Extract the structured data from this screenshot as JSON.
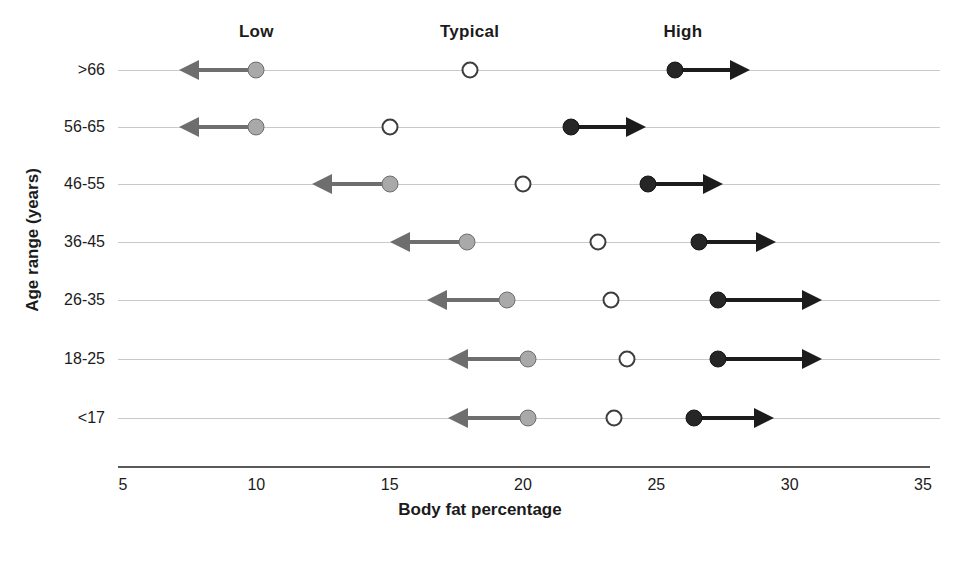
{
  "chart_data": {
    "type": "scatter",
    "title": "",
    "xlabel": "Body fat percentage",
    "ylabel": "Age range (years)",
    "xlim": [
      5,
      35
    ],
    "xticks": [
      5,
      10,
      15,
      20,
      25,
      30,
      35
    ],
    "xtick_labels": [
      "5",
      "10",
      "15",
      "20",
      "25",
      "30",
      "35"
    ],
    "grid": false,
    "legend_position": "top",
    "column_headers": [
      "Low",
      "Typical",
      "High"
    ],
    "column_header_x": [
      10,
      18,
      26
    ],
    "series": [
      {
        "name": "Low",
        "marker": "filled-gray-circle",
        "direction": "left",
        "color": "#a9a9a9"
      },
      {
        "name": "Typical",
        "marker": "open-circle",
        "direction": "none",
        "color": "#ffffff"
      },
      {
        "name": "High",
        "marker": "filled-black-circle",
        "direction": "right",
        "color": "#262626"
      }
    ],
    "categories": [
      ">66",
      "56-65",
      "46-55",
      "36-45",
      "26-35",
      "18-25",
      "<17"
    ],
    "rows": [
      {
        "age_range": ">66",
        "low": 10.0,
        "low_arrow_end": 7.1,
        "typical": 18.0,
        "high": 25.7,
        "high_arrow_end": 28.5
      },
      {
        "age_range": "56-65",
        "low": 10.0,
        "low_arrow_end": 7.1,
        "typical": 15.0,
        "high": 21.8,
        "high_arrow_end": 24.6
      },
      {
        "age_range": "46-55",
        "low": 15.0,
        "low_arrow_end": 12.1,
        "typical": 20.0,
        "high": 24.7,
        "high_arrow_end": 27.5
      },
      {
        "age_range": "36-45",
        "low": 17.9,
        "low_arrow_end": 15.0,
        "typical": 22.8,
        "high": 26.6,
        "high_arrow_end": 29.5
      },
      {
        "age_range": "26-35",
        "low": 19.4,
        "low_arrow_end": 16.4,
        "typical": 23.3,
        "high": 27.3,
        "high_arrow_end": 31.2
      },
      {
        "age_range": "18-25",
        "low": 20.2,
        "low_arrow_end": 17.2,
        "typical": 23.9,
        "high": 27.3,
        "high_arrow_end": 31.2
      },
      {
        "age_range": "<17",
        "low": 20.2,
        "low_arrow_end": 17.2,
        "typical": 23.4,
        "high": 26.4,
        "high_arrow_end": 29.4
      }
    ]
  }
}
